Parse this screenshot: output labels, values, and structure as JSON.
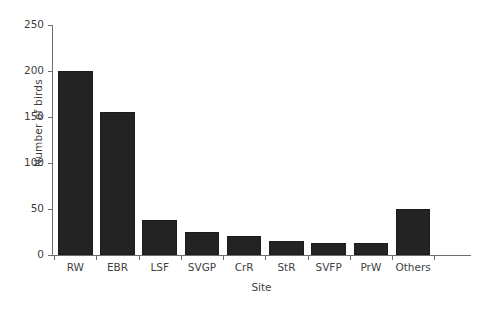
{
  "chart_data": {
    "type": "bar",
    "title": "",
    "xlabel": "Site",
    "ylabel": "Number of birds",
    "categories": [
      "RW",
      "EBR",
      "LSF",
      "SVGP",
      "CrR",
      "StR",
      "SVFP",
      "PrW",
      "Others"
    ],
    "values": [
      200,
      155,
      38,
      25,
      21,
      15,
      13,
      13,
      50
    ],
    "ylim": [
      0,
      250
    ],
    "yticks": [
      0,
      50,
      100,
      150,
      200,
      250
    ],
    "ytick_labels": [
      "0",
      "50",
      "100",
      "150",
      "200",
      "250"
    ],
    "grid": false,
    "legend": null,
    "bar_color": "#232323",
    "axis_color": "#6e6e6e",
    "text_color": "#3f3f3f"
  }
}
